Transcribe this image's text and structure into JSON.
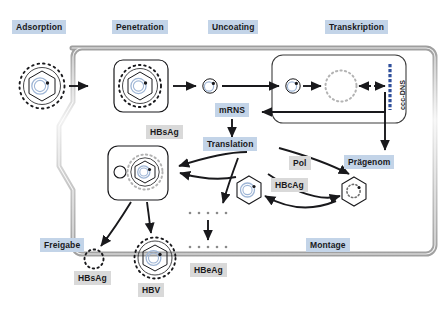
{
  "diagram": {
    "title_context": "Hepatitis B virus (HBV) replication cycle schematic",
    "language": "de",
    "stage_labels": [
      {
        "id": "adsorption",
        "text": "Adsorption",
        "style": "blue",
        "x": 12,
        "y": 20
      },
      {
        "id": "penetration",
        "text": "Penetration",
        "style": "blue",
        "x": 112,
        "y": 20
      },
      {
        "id": "uncoating",
        "text": "Uncoating",
        "style": "blue",
        "x": 208,
        "y": 20
      },
      {
        "id": "transkription",
        "text": "Transkription",
        "style": "blue",
        "x": 325,
        "y": 20
      },
      {
        "id": "mrns",
        "text": "mRNS",
        "style": "blue",
        "x": 215,
        "y": 104
      },
      {
        "id": "translation",
        "text": "Translation",
        "style": "blue",
        "x": 206,
        "y": 143
      },
      {
        "id": "praegenom",
        "text": "Prägenom",
        "style": "blue",
        "x": 345,
        "y": 157
      },
      {
        "id": "freigabe",
        "text": "Freigabe",
        "style": "blue",
        "x": 40,
        "y": 240
      },
      {
        "id": "montage",
        "text": "Montage",
        "style": "blue",
        "x": 307,
        "y": 240
      }
    ],
    "protein_labels": [
      {
        "id": "hbsag-cell",
        "text": "HBsAg",
        "style": "grey",
        "x": 147,
        "y": 127
      },
      {
        "id": "pol",
        "text": "Pol",
        "style": "grey",
        "x": 290,
        "y": 158
      },
      {
        "id": "hbcag",
        "text": "HBcAg",
        "style": "grey",
        "x": 272,
        "y": 180
      },
      {
        "id": "hbsag-out",
        "text": "HBsAg",
        "style": "grey",
        "x": 74,
        "y": 272
      },
      {
        "id": "hbv",
        "text": "HBV",
        "style": "grey",
        "x": 138,
        "y": 284
      },
      {
        "id": "hbeag",
        "text": "HBeAg",
        "style": "grey",
        "x": 191,
        "y": 266
      }
    ],
    "ccc_dns": {
      "text": "ccc-DNS",
      "x": 398,
      "y": 104
    },
    "colors": {
      "label_blue": "#c3d4e8",
      "label_grey": "#d9d9d9",
      "membrane": "#b9b9b9",
      "membrane_highlight": "#e8e8e8",
      "capsid_blue": "#9fb6d6",
      "ink": "#19191c",
      "ccc_dns_bar": "#2f4f9b"
    },
    "particles": [
      {
        "id": "virion-extracellular",
        "kind": "enveloped-virion",
        "cx": 42,
        "cy": 86
      },
      {
        "id": "virion-penetrating",
        "kind": "enveloped-virion",
        "cx": 140,
        "cy": 86
      },
      {
        "id": "core-uncoated",
        "kind": "small-core",
        "cx": 210,
        "cy": 86
      },
      {
        "id": "core-nuclear",
        "kind": "small-core",
        "cx": 293,
        "cy": 86
      },
      {
        "id": "rcdna-circle",
        "kind": "dashed-circle",
        "cx": 340,
        "cy": 86
      },
      {
        "id": "virion-budding",
        "kind": "enveloped-virion-in-vesicle",
        "cx": 145,
        "cy": 172
      },
      {
        "id": "nucleocapsid-mature",
        "kind": "hex-core",
        "cx": 249,
        "cy": 190
      },
      {
        "id": "nucleocapsid-pregenome",
        "kind": "hex-core",
        "cx": 354,
        "cy": 192
      },
      {
        "id": "hbsag-particle",
        "kind": "dotted-circle",
        "cx": 94,
        "cy": 259
      },
      {
        "id": "hbv-virion",
        "kind": "enveloped-virion",
        "cx": 155,
        "cy": 258
      }
    ],
    "dot_rows": [
      {
        "id": "hbeag-dots-inside",
        "y": 213,
        "x": 190,
        "count": 5
      },
      {
        "id": "hbeag-dots-outside",
        "y": 247,
        "x": 190,
        "count": 5
      }
    ]
  }
}
